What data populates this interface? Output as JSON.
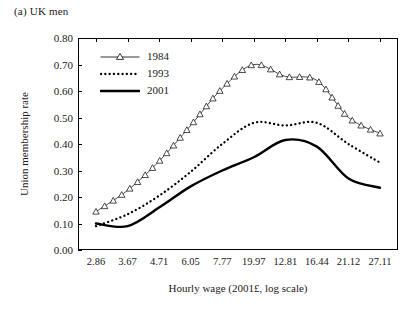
{
  "panel": {
    "label": "(a) UK men"
  },
  "axes": {
    "ylabel": "Union membership rate",
    "xlabel": "Hourly wage (2001£, log scale)",
    "yticks": [
      "0.00",
      "0.10",
      "0.20",
      "0.30",
      "0.40",
      "0.50",
      "0.60",
      "0.70",
      "0.80"
    ],
    "xticks": [
      "2.86",
      "3.67",
      "4.71",
      "6.05",
      "7.77",
      "19.97",
      "12.81",
      "16.44",
      "21.12",
      "27.11"
    ]
  },
  "legend": {
    "items": [
      {
        "label": "1984",
        "style": "line-marker-triangle",
        "color": "#000000"
      },
      {
        "label": "1993",
        "style": "dotted",
        "color": "#000000"
      },
      {
        "label": "2001",
        "style": "thick-solid",
        "color": "#000000"
      }
    ]
  },
  "chart_data": {
    "type": "line",
    "title": "(a) UK men",
    "xlabel": "Hourly wage (2001£, log scale)",
    "ylabel": "Union membership rate",
    "ylim": [
      0.0,
      0.8
    ],
    "grid": false,
    "legend_position": "top-left",
    "xscale": "log",
    "categories": [
      "2.86",
      "3.67",
      "4.71",
      "6.05",
      "7.77",
      "19.97",
      "12.81",
      "16.44",
      "21.12",
      "27.11"
    ],
    "x": [
      2.86,
      3.67,
      4.71,
      6.05,
      7.77,
      9.97,
      12.81,
      16.44,
      21.12,
      27.11
    ],
    "series": [
      {
        "name": "1984",
        "marker": "open-triangle",
        "values": [
          0.145,
          0.225,
          0.335,
          0.47,
          0.61,
          0.7,
          0.655,
          0.64,
          0.5,
          0.44
        ]
      },
      {
        "name": "1993",
        "marker": "none",
        "values": [
          0.09,
          0.135,
          0.205,
          0.295,
          0.4,
          0.48,
          0.47,
          0.48,
          0.4,
          0.33
        ]
      },
      {
        "name": "2001",
        "marker": "none",
        "values": [
          0.1,
          0.09,
          0.16,
          0.24,
          0.3,
          0.35,
          0.415,
          0.39,
          0.27,
          0.235
        ]
      }
    ]
  }
}
